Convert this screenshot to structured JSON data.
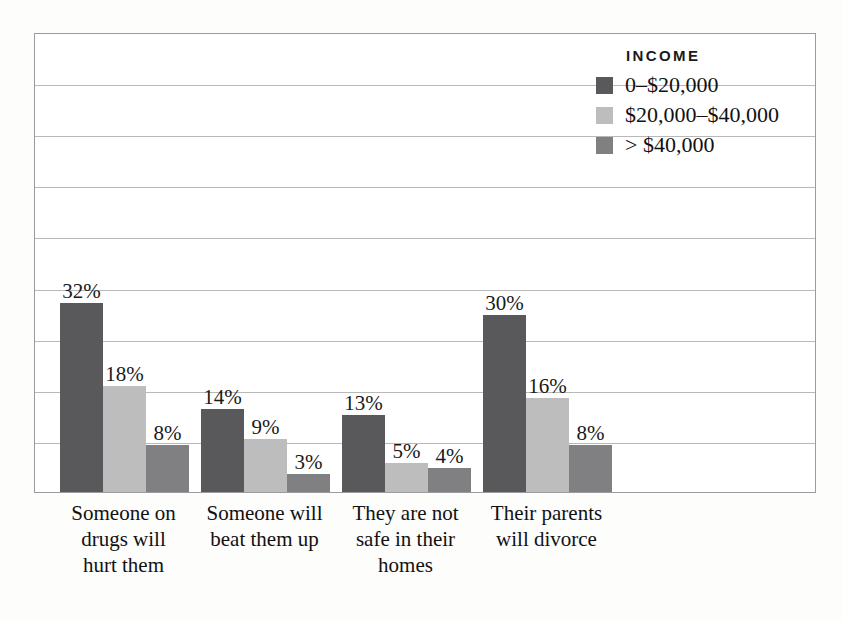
{
  "chart_data": {
    "type": "bar",
    "title": "",
    "subtitle": "",
    "xlabel": "",
    "ylabel": "",
    "grid": true,
    "gridlines": 8,
    "ylim": [
      0,
      78
    ],
    "legend_position": "top-right",
    "legend_title": "INCOME",
    "categories": [
      "Someone on drugs will hurt them",
      "Someone will beat them up",
      "They are not safe in their homes",
      "Their parents will divorce"
    ],
    "category_lines": [
      [
        "Someone on",
        "drugs will",
        "hurt them"
      ],
      [
        "Someone will",
        "beat them up"
      ],
      [
        "They are not",
        "safe in their",
        "homes"
      ],
      [
        "Their parents",
        "will divorce"
      ]
    ],
    "series": [
      {
        "name": "0–$20,000",
        "color": "#59595b",
        "values": [
          32,
          14,
          13,
          30
        ],
        "labels": [
          "32%",
          "14%",
          "13%",
          "30%"
        ]
      },
      {
        "name": "$20,000–$40,000",
        "color": "#bdbdbd",
        "values": [
          18,
          9,
          5,
          16
        ],
        "labels": [
          "18%",
          "9%",
          "5%",
          "16%"
        ]
      },
      {
        "name": "> $40,000",
        "color": "#808083",
        "values": [
          8,
          3,
          4,
          8
        ],
        "labels": [
          "8%",
          "3%",
          "4%",
          "8%"
        ]
      }
    ]
  },
  "colors": {
    "series_dark": "#59595b",
    "series_light": "#bdbdbd",
    "series_medium": "#808083",
    "gridline": "#b8b8b8",
    "plot_border": "#9b9b9b",
    "plot_background": "#ffffff",
    "figure_background": "#fdfdfc",
    "text": "#111111"
  },
  "legend": {
    "title": "INCOME",
    "items": [
      {
        "label": "0–$20,000",
        "color": "#59595b"
      },
      {
        "label": "$20,000–$40,000",
        "color": "#bdbdbd"
      },
      {
        "label": "> $40,000",
        "color": "#808083"
      }
    ]
  }
}
